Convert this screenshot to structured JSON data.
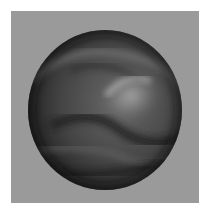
{
  "image": {
    "subject": "3D rendered bumpy dark sphere with wavy ridged surface",
    "background_color": "#9a9a9a",
    "border_color": "#ffffff",
    "sphere_color": "#3a3a3a",
    "highlight_color": "#9c9c9c"
  }
}
